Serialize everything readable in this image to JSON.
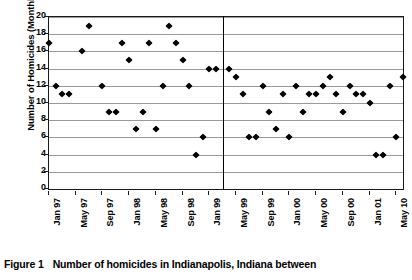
{
  "figure": {
    "caption_label": "Figure 1",
    "caption_text": "Number of homicides in Indianapolis, Indiana between"
  },
  "chart_data": {
    "type": "scatter",
    "title": "",
    "xlabel": "",
    "ylabel": "Number of Homicides (Monthly)",
    "ylim": [
      0,
      20
    ],
    "ytick_step": 2,
    "ytick_labels": [
      "0",
      "2",
      "4",
      "6",
      "8",
      "10",
      "12",
      "14",
      "16",
      "18",
      "20"
    ],
    "grid": true,
    "grid_axis": "y",
    "legend": "none",
    "marker": "diamond",
    "marker_color": "#000000",
    "xtick_labels": [
      "Jan 97",
      "May 97",
      "Sep 97",
      "Jan 98",
      "May 98",
      "Sep 98",
      "Jan 99",
      "May 99",
      "Sep 99",
      "Jan 00",
      "May 00",
      "Sep 00",
      "Jan 01",
      "May 10"
    ],
    "xtick_index": [
      0,
      4,
      8,
      12,
      16,
      20,
      24,
      28,
      32,
      36,
      40,
      44,
      48,
      52
    ],
    "x_index_range": [
      0,
      53
    ],
    "annotations": [
      {
        "type": "vertical-line",
        "name": "intervention-line",
        "x_index": 26,
        "color": "#000000"
      }
    ],
    "series": [
      {
        "name": "Monthly homicides",
        "x": [
          0,
          1,
          2,
          3,
          5,
          6,
          8,
          9,
          10,
          11,
          12,
          13,
          14,
          15,
          16,
          17,
          18,
          19,
          20,
          21,
          22,
          23,
          24,
          25,
          27,
          28,
          29,
          30,
          31,
          32,
          33,
          34,
          35,
          36,
          37,
          38,
          39,
          40,
          41,
          42,
          43,
          44,
          45,
          46,
          47,
          48,
          49,
          50,
          51,
          52,
          53
        ],
        "values": [
          17,
          12,
          11,
          11,
          16,
          19,
          12,
          9,
          9,
          17,
          15,
          7,
          9,
          17,
          7,
          12,
          19,
          17,
          15,
          12,
          4,
          6,
          14,
          14,
          14,
          13,
          11,
          6,
          6,
          12,
          9,
          7,
          11,
          6,
          12,
          9,
          11,
          11,
          12,
          13,
          11,
          9,
          12,
          11,
          11,
          10,
          4,
          4,
          12,
          6,
          13
        ]
      }
    ]
  }
}
